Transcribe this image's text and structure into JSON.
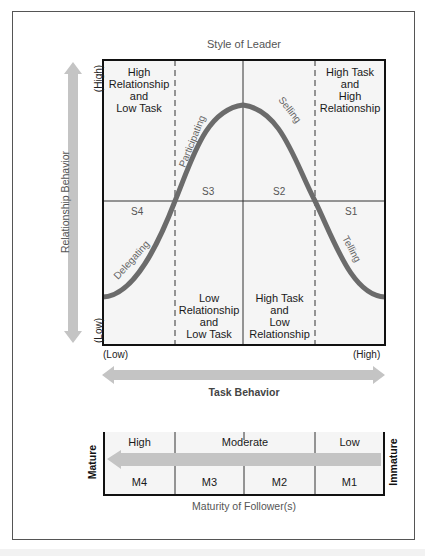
{
  "diagram": {
    "title": "Style of Leader",
    "y_axis": {
      "label": "Relationship Behavior",
      "high": "(High)",
      "low": "(Low)"
    },
    "x_axis": {
      "label": "Task Behavior",
      "low": "(Low)",
      "high": "(High)"
    },
    "quadrants": [
      {
        "id": "top-left",
        "lines": [
          "High",
          "Relationship",
          "and",
          "Low Task"
        ]
      },
      {
        "id": "top-right",
        "lines": [
          "High Task",
          "and",
          "High",
          "Relationship"
        ]
      },
      {
        "id": "bottom-left",
        "lines": [
          "Low",
          "Relationship",
          "and",
          "Low Task"
        ]
      },
      {
        "id": "bottom-right",
        "lines": [
          "High Task",
          "and",
          "Low",
          "Relationship"
        ]
      }
    ],
    "styles": [
      {
        "code": "S1",
        "name": "Telling"
      },
      {
        "code": "S2",
        "name": "Selling"
      },
      {
        "code": "S3",
        "name": "Participating"
      },
      {
        "code": "S4",
        "name": "Delegating"
      }
    ],
    "maturity": {
      "title": "Maturity of Follower(s)",
      "left_label": "Mature",
      "right_label": "Immature",
      "levels": [
        "High",
        "Moderate",
        "Low"
      ],
      "codes": [
        "M4",
        "M3",
        "M2",
        "M1"
      ]
    },
    "colors": {
      "curve": "#6b6b6b",
      "arrow": "#c4c4c4",
      "box_fill": "#f5f5f5",
      "border": "#111111"
    }
  }
}
